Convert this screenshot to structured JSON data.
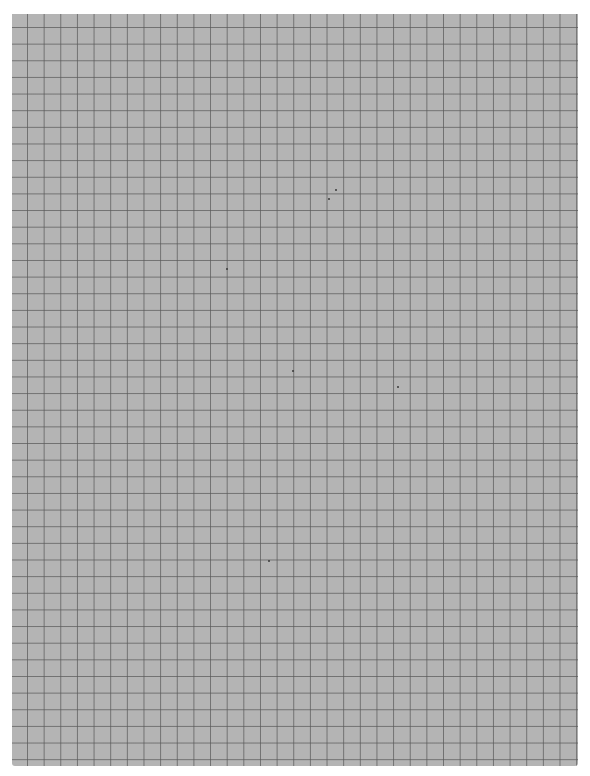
{
  "document": {
    "type": "graph-paper",
    "background_color": "#b4b4b4",
    "grid_line_color": "#5a5a5a",
    "page_color": "#ffffff",
    "grid_columns": 34,
    "grid_rows": 45
  },
  "specks": [
    {
      "x": 335,
      "y": 189
    },
    {
      "x": 328,
      "y": 198
    },
    {
      "x": 226,
      "y": 268
    },
    {
      "x": 292,
      "y": 370
    },
    {
      "x": 397,
      "y": 386
    },
    {
      "x": 268,
      "y": 560
    }
  ]
}
